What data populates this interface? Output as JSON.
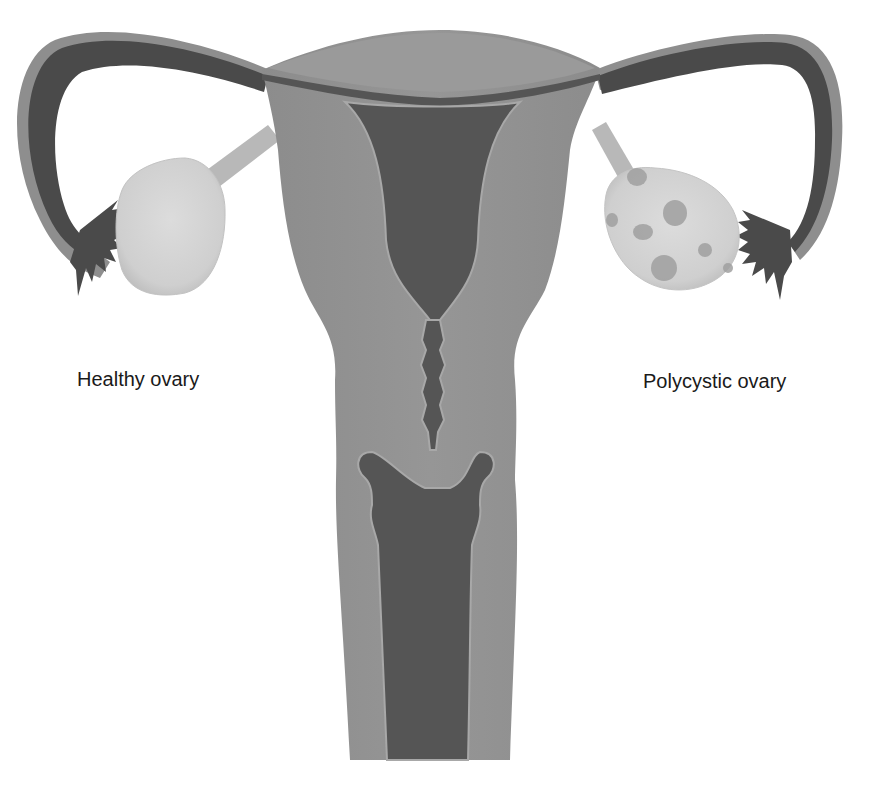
{
  "diagram": {
    "labels": {
      "left": "Healthy ovary",
      "right": "Polycystic ovary"
    },
    "colors": {
      "background": "#ffffff",
      "tissue_outer": "#8a8a8a",
      "tissue_mid": "#939393",
      "tissue_edge": "#a8a8a8",
      "lumen_dark": "#555555",
      "tube_dark": "#4a4a4a",
      "ovary_light": "#d4d4d4",
      "ligament": "#b8b8b8",
      "cyst": "#9e9e9e",
      "text": "#1a1a1a"
    },
    "parts": [
      "left-fallopian-tube",
      "right-fallopian-tube",
      "left-fimbriae",
      "right-fimbriae",
      "healthy-ovary",
      "polycystic-ovary",
      "ovarian-ligaments",
      "uterine-fundus",
      "uterine-cavity",
      "cervical-canal",
      "cervix",
      "vagina"
    ]
  }
}
